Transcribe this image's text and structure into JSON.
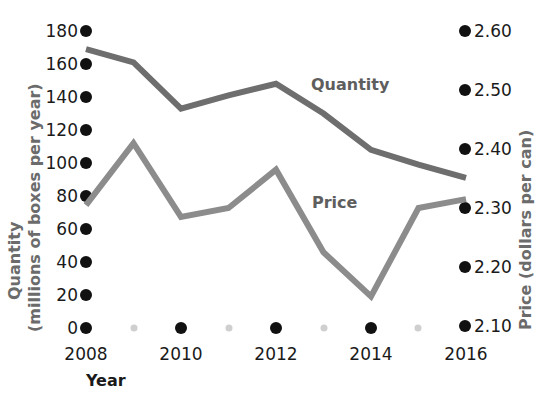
{
  "chart_data": {
    "type": "line",
    "title": "",
    "xlabel": "Year",
    "x": [
      2008,
      2009,
      2010,
      2011,
      2012,
      2013,
      2014,
      2015,
      2016
    ],
    "xlim": [
      2008,
      2016
    ],
    "x_tick_labels": [
      "2008",
      "2010",
      "2012",
      "2014",
      "2016"
    ],
    "x_ticks": [
      2008,
      2010,
      2012,
      2014,
      2016
    ],
    "x_minor_ticks": [
      2009,
      2011,
      2013,
      2015
    ],
    "grid": false,
    "legend": "inline-labels",
    "series": [
      {
        "name": "Quantity",
        "axis": "left",
        "color": "#6e6e6e",
        "values": [
          169,
          161,
          133,
          141,
          148,
          130,
          108,
          99,
          91
        ]
      },
      {
        "name": "Price",
        "axis": "right",
        "color": "#8c8c8c",
        "values": [
          2.305,
          2.41,
          2.285,
          2.3,
          2.365,
          2.225,
          2.15,
          2.3,
          2.315
        ]
      }
    ],
    "left_axis": {
      "label_line1": "Quantity",
      "label_line2": "(millions of boxes per year)",
      "ylim": [
        0,
        180
      ],
      "tick_labels": [
        "180",
        "160",
        "140",
        "120",
        "100",
        "80",
        "60",
        "40",
        "20",
        "0"
      ],
      "ticks": [
        180,
        160,
        140,
        120,
        100,
        80,
        60,
        40,
        20,
        0
      ]
    },
    "right_axis": {
      "label": "Price (dollars per can)",
      "ylim": [
        2.1,
        2.6
      ],
      "tick_labels": [
        "2.60",
        "2.50",
        "2.40",
        "2.30",
        "2.20",
        "2.10"
      ],
      "ticks": [
        2.6,
        2.5,
        2.4,
        2.3,
        2.2,
        2.1
      ]
    },
    "annotations": [
      {
        "text": "Quantity",
        "x": 2012.8,
        "y_left": 145
      },
      {
        "text": "Price",
        "x": 2013.0,
        "y_left": 72
      }
    ]
  },
  "colors": {
    "quantity_line": "#6e6e6e",
    "price_line": "#8c8c8c",
    "tick_dot_major": "#111111",
    "tick_dot_minor": "#cfcfcf",
    "axis_title_gray": "#6b6b6b",
    "tick_text": "#1a1a1a",
    "background": "#ffffff"
  },
  "labels": {
    "quantity_series": "Quantity",
    "price_series": "Price",
    "left_title_1": "Quantity",
    "left_title_2": "(millions of boxes per year)",
    "right_title": "Price (dollars per can)",
    "x_title": "Year",
    "y_180": "180",
    "y_160": "160",
    "y_140": "140",
    "y_120": "120",
    "y_100": "100",
    "y_80": "80",
    "y_60": "60",
    "y_40": "40",
    "y_20": "20",
    "y_0": "0",
    "p_260": "2.60",
    "p_250": "2.50",
    "p_240": "2.40",
    "p_230": "2.30",
    "p_220": "2.20",
    "p_210": "2.10",
    "x_2008": "2008",
    "x_2010": "2010",
    "x_2012": "2012",
    "x_2014": "2014",
    "x_2016": "2016"
  }
}
